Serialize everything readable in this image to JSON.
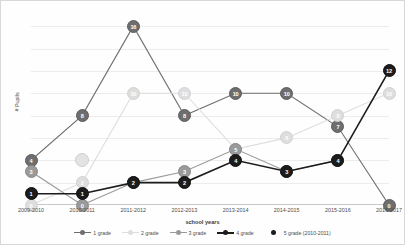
{
  "chart_data": {
    "type": "line",
    "title": "",
    "xlabel": "school years",
    "ylabel": "# Pupils",
    "categories": [
      "2009-2010",
      "2010-2011",
      "2011-2012",
      "2012-2013",
      "2013-2014",
      "2014-2015",
      "2015-2016",
      "2016-2017"
    ],
    "ylim": [
      0,
      17
    ],
    "grid": true,
    "legend_position": "bottom",
    "series": [
      {
        "name": "1 grade",
        "color": "#6e6e6e",
        "marker_style": "line-marker",
        "values": [
          4,
          8,
          16,
          8,
          10,
          10,
          7,
          0
        ],
        "labels": [
          "4",
          "8",
          "16",
          "8",
          "10",
          "10",
          "7",
          "0"
        ]
      },
      {
        "name": "2 grade",
        "color": "#dedede",
        "marker_style": "line-marker",
        "values": [
          0,
          2,
          10,
          10,
          5,
          6,
          8,
          10
        ],
        "labels": [
          "0",
          "2",
          "10",
          "10",
          "5",
          "6",
          "8",
          "10"
        ]
      },
      {
        "name": "3 grade",
        "color": "#9a9a9a",
        "marker_style": "line-marker",
        "values": [
          3,
          0,
          2,
          3,
          5,
          3,
          4,
          null
        ],
        "labels": [
          "3",
          "0",
          "2",
          "3",
          "5",
          "3",
          "4",
          ""
        ]
      },
      {
        "name": "4 grade",
        "color": "#1c1c1c",
        "marker_style": "line-marker",
        "values": [
          1,
          1,
          2,
          2,
          4,
          3,
          4,
          12
        ],
        "labels": [
          "1",
          "1",
          "2",
          "2",
          "4",
          "3",
          "4",
          "12"
        ]
      },
      {
        "name": "5 grade (2010-2011)",
        "color": "#e3e3e3",
        "marker_style": "dot-only",
        "values": [
          null,
          4,
          null,
          null,
          null,
          null,
          null,
          null
        ],
        "labels": [
          "",
          "",
          "",
          "",
          "",
          "",
          "",
          ""
        ]
      }
    ]
  },
  "axis": {
    "x_title": "school years",
    "y_title": "# Pupils"
  }
}
